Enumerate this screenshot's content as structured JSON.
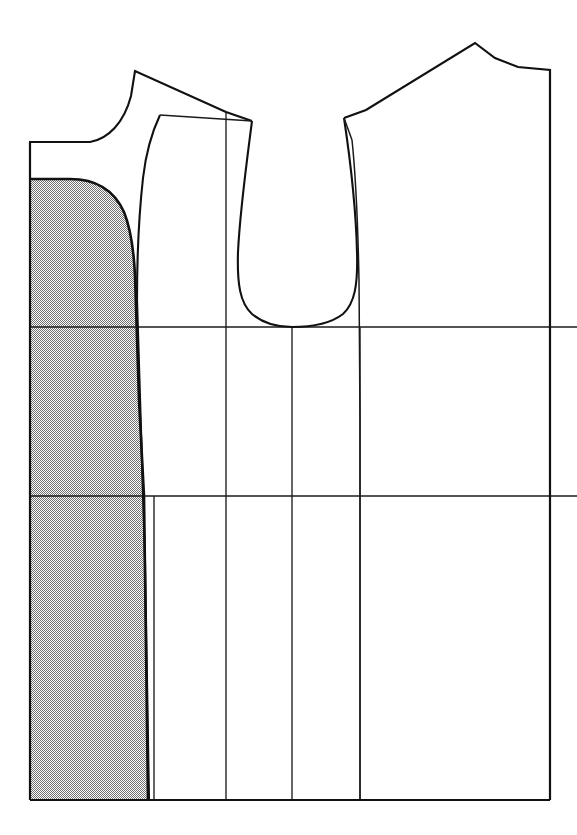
{
  "figure": {
    "kind": "garment-pattern-draft",
    "width": 577,
    "height": 835,
    "background_color": "#ffffff",
    "line_color": "#111111",
    "shade_color": "#b9b9b9",
    "shade_pattern": "fine-checkerboard-dot-screen"
  },
  "chart_data": {
    "type": "diagram",
    "xlabel": "",
    "ylabel": "",
    "xlim": [
      0,
      577
    ],
    "ylim": [
      0,
      835
    ],
    "grid": false,
    "legend": "none",
    "annotations": [],
    "elements": [
      {
        "name": "left-bodice-outline",
        "kind": "closed-path",
        "stroke": "#111111",
        "fill": "none",
        "points": [
          [
            30,
            142
          ],
          [
            30,
            800
          ],
          [
            148,
            800
          ],
          [
            144,
            496
          ],
          [
            140,
            327
          ],
          [
            135,
            235
          ],
          [
            137,
            169
          ],
          [
            146,
            134
          ],
          [
            160,
            115
          ],
          [
            252,
            121
          ],
          [
            226,
            112
          ],
          [
            135,
            71
          ]
        ]
      },
      {
        "name": "left-armhole-curve",
        "kind": "open-path",
        "stroke": "#111111",
        "fill": "none",
        "points": [
          [
            252,
            121
          ],
          [
            243,
            180
          ],
          [
            238,
            245
          ],
          [
            238,
            285
          ],
          [
            248,
            311
          ],
          [
            270,
            325
          ],
          [
            292,
            327
          ]
        ]
      },
      {
        "name": "right-armhole-curve",
        "kind": "open-path",
        "stroke": "#111111",
        "fill": "none",
        "points": [
          [
            344,
            118
          ],
          [
            352,
            180
          ],
          [
            357,
            245
          ],
          [
            357,
            285
          ],
          [
            345,
            312
          ],
          [
            320,
            326
          ],
          [
            292,
            327
          ]
        ]
      },
      {
        "name": "right-bodice-outline",
        "kind": "closed-path",
        "stroke": "#111111",
        "fill": "none",
        "points": [
          [
            344,
            118
          ],
          [
            366,
            110
          ],
          [
            475,
            43
          ],
          [
            500,
            60
          ],
          [
            524,
            68
          ],
          [
            550,
            70
          ],
          [
            550,
            800
          ],
          [
            360,
            800
          ],
          [
            360,
            496
          ],
          [
            360,
            327
          ],
          [
            358,
            200
          ],
          [
            352,
            140
          ]
        ]
      },
      {
        "name": "bust-line",
        "kind": "horizontal-line",
        "stroke": "#1b1b1b",
        "y": 327,
        "x0": 30,
        "x1": 577
      },
      {
        "name": "waist-line",
        "kind": "horizontal-line",
        "stroke": "#1b1b1b",
        "y": 496,
        "x0": 30,
        "x1": 577
      },
      {
        "name": "hem-line",
        "kind": "horizontal-line",
        "stroke": "#111111",
        "y": 800,
        "x0": 30,
        "x1": 550
      },
      {
        "name": "left-side-seam-construction",
        "kind": "vertical-line",
        "stroke": "#1b1b1b",
        "x": 154,
        "y0": 496,
        "y1": 800
      },
      {
        "name": "front-panel-construction-line",
        "kind": "vertical-line",
        "stroke": "#1b1b1b",
        "x": 226,
        "y0": 112,
        "y1": 800
      },
      {
        "name": "center-front-line",
        "kind": "vertical-line",
        "stroke": "#1b1b1b",
        "x": 292,
        "y0": 327,
        "y1": 800
      },
      {
        "name": "back-panel-construction-line",
        "kind": "vertical-line",
        "stroke": "#1b1b1b",
        "x": 360,
        "y0": 327,
        "y1": 800
      },
      {
        "name": "right-side-edge",
        "kind": "vertical-line",
        "stroke": "#111111",
        "x": 550,
        "y0": 70,
        "y1": 800
      },
      {
        "name": "shaded-side-panel",
        "kind": "filled-region",
        "fill": "#b9b9b9",
        "stroke": "#111111",
        "description": "shaded panel bounded left by the center back line, top by a rounded cap, right by the curved side seam, bottom by the hem",
        "points": [
          [
            30,
            179
          ],
          [
            70,
            179
          ],
          [
            100,
            187
          ],
          [
            120,
            208
          ],
          [
            131,
            239
          ],
          [
            134,
            272
          ],
          [
            137,
            330
          ],
          [
            141,
            420
          ],
          [
            144,
            496
          ],
          [
            146,
            620
          ],
          [
            148,
            800
          ],
          [
            30,
            800
          ]
        ]
      }
    ]
  }
}
